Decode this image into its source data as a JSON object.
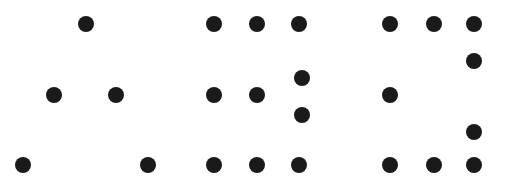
{
  "diagram": {
    "dot_color": "#1a1a1a",
    "dot_radius": 8,
    "figures": [
      {
        "name": "dot-figure-a",
        "dots": [
          [
            86,
            24
          ],
          [
            54,
            95
          ],
          [
            116,
            95
          ],
          [
            23,
            165
          ],
          [
            148,
            165
          ]
        ]
      },
      {
        "name": "dot-figure-b",
        "dots": [
          [
            214,
            24
          ],
          [
            257,
            24
          ],
          [
            299,
            24
          ],
          [
            302,
            78
          ],
          [
            214,
            95
          ],
          [
            257,
            95
          ],
          [
            302,
            115
          ],
          [
            214,
            165
          ],
          [
            257,
            165
          ],
          [
            299,
            165
          ]
        ]
      },
      {
        "name": "dot-figure-c",
        "dots": [
          [
            390,
            24
          ],
          [
            434,
            24
          ],
          [
            474,
            24
          ],
          [
            474,
            61
          ],
          [
            390,
            95
          ],
          [
            474,
            132
          ],
          [
            390,
            165
          ],
          [
            434,
            165
          ],
          [
            474,
            165
          ]
        ]
      }
    ]
  }
}
